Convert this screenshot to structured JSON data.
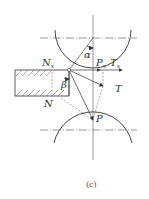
{
  "figure": {
    "caption": "(c)",
    "labels": {
      "Nx": {
        "main": "N",
        "sub": "x"
      },
      "alpha": "α",
      "Px": {
        "main": "P",
        "sub": "x"
      },
      "Tx": {
        "main": "T",
        "sub": "x"
      },
      "T": "T",
      "beta": "β",
      "N": "N",
      "P": "P"
    },
    "colors": {
      "line": "#333333",
      "background": "#ffffff"
    }
  }
}
